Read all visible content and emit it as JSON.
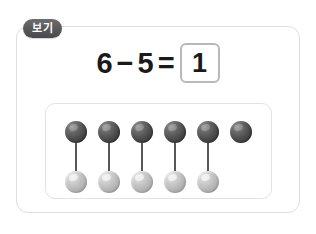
{
  "badge": {
    "label": "보기"
  },
  "equation": {
    "left_operand": "6",
    "operator": "−",
    "right_operand": "5",
    "equals": "=",
    "answer": "1"
  },
  "manipulatives": {
    "top_row_label": "dark-beads",
    "bottom_row_label": "light-beads",
    "top_count": 6,
    "bottom_count": 5,
    "columns": [
      {
        "top": true,
        "connector": true,
        "bottom": true
      },
      {
        "top": true,
        "connector": true,
        "bottom": true
      },
      {
        "top": true,
        "connector": true,
        "bottom": true
      },
      {
        "top": true,
        "connector": true,
        "bottom": true
      },
      {
        "top": true,
        "connector": true,
        "bottom": true
      },
      {
        "top": true,
        "connector": false,
        "bottom": false
      }
    ]
  },
  "colors": {
    "frame_border": "#dedede",
    "panel_border": "#e2e2e2",
    "badge_background": "#58585a",
    "badge_text": "#ffffff",
    "answer_box_border": "#b9b9b9",
    "text": "#1a1a1a",
    "bead_dark": "#4a4a4a",
    "bead_light": "#b4b4b4",
    "connector": "#58585a",
    "page_background": "#ffffff"
  }
}
